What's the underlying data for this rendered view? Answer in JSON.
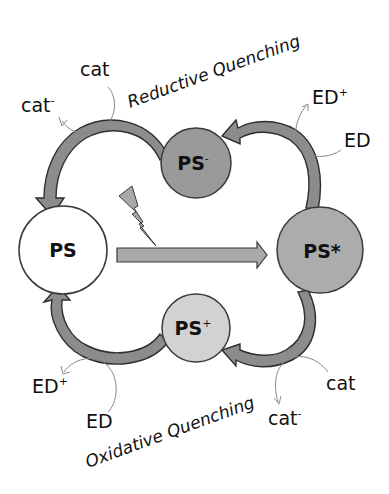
{
  "diagram": {
    "type": "photoredox catalytic cycle",
    "colors": {
      "background": "#ffffff",
      "ps_fill": "#ffffff",
      "ps_minus_fill": "#9a9a9a",
      "ps_star_fill": "#acacac",
      "ps_plus_fill": "#d2d2d2",
      "arrow_fill": "#8c8c8c",
      "outline": "#3a3a3a",
      "thin_arrow": "#888888"
    },
    "nodes": {
      "ps": {
        "label": "PS",
        "sup": ""
      },
      "ps_minus": {
        "label": "PS",
        "sup": "-"
      },
      "ps_star": {
        "label": "PS*",
        "sup": ""
      },
      "ps_plus": {
        "label": "PS",
        "sup": "+"
      }
    },
    "cycles": {
      "reductive": {
        "title": "Reductive Quenching"
      },
      "oxidative": {
        "title": "Oxidative Quenching"
      }
    },
    "species": {
      "top_left_cat": {
        "label": "cat",
        "sup": ""
      },
      "top_left_cat_reduced": {
        "label": "cat",
        "sup": "-"
      },
      "top_right_ed_oxidized": {
        "label": "ED",
        "sup": "+"
      },
      "top_right_ed": {
        "label": "ED",
        "sup": ""
      },
      "bottom_left_ed_oxidized": {
        "label": "ED",
        "sup": "+"
      },
      "bottom_left_ed": {
        "label": "ED",
        "sup": ""
      },
      "bottom_right_cat": {
        "label": "cat",
        "sup": ""
      },
      "bottom_right_cat_reduced": {
        "label": "cat",
        "sup": "-"
      }
    },
    "excitation": {
      "icon": "lightning-bolt-icon",
      "arrow": "excitation-arrow"
    }
  }
}
